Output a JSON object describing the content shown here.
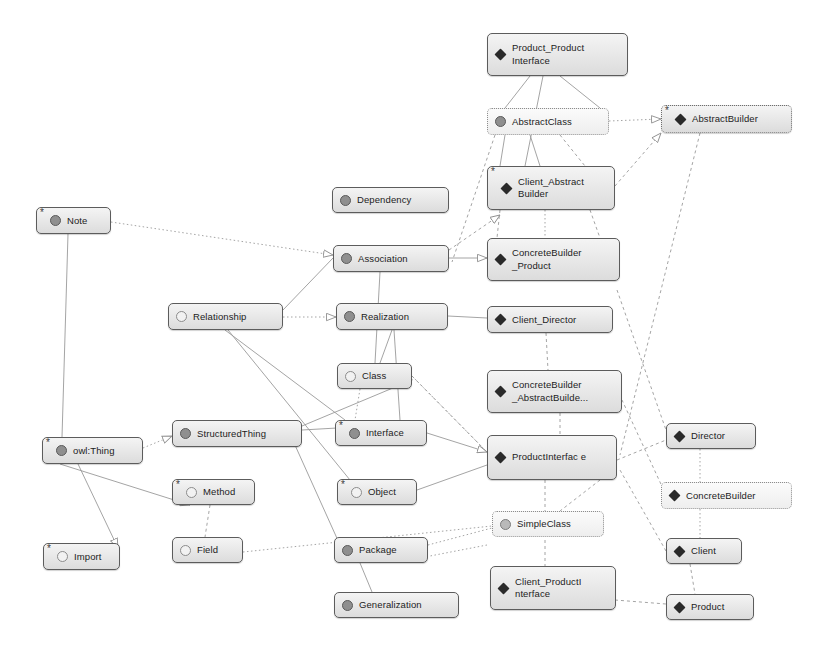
{
  "diagram": {
    "type": "node-link-graph",
    "width": 834,
    "height": 655,
    "background_color": "#ffffff",
    "node_fill_color": "#e4e4e4",
    "node_border_color": "#5c5c5c",
    "edge_color": "#9a9a9a",
    "icon_legend": [
      {
        "name": "diamond-icon",
        "meaning": "instance / individual"
      },
      {
        "name": "circle-dark-icon",
        "meaning": "class with subclasses"
      },
      {
        "name": "circle-light-icon",
        "meaning": "leaf class"
      }
    ],
    "nodes": [
      {
        "id": "product_product_interface",
        "label": "Product_Product\nInterface",
        "line1": "Product_Product",
        "line2": "Interface",
        "icon": "diamond-icon",
        "star": false,
        "style": "solid",
        "x": 487,
        "y": 33,
        "w": 141,
        "h": 43
      },
      {
        "id": "abstract_class",
        "label": "AbstractClass",
        "line1": "AbstractClass",
        "line2": "",
        "icon": "circle-dark-icon",
        "star": false,
        "style": "light",
        "x": 487,
        "y": 108,
        "w": 122,
        "h": 27
      },
      {
        "id": "abstract_builder",
        "label": "AbstractBuilder",
        "line1": "AbstractBuilder",
        "line2": "",
        "icon": "diamond-icon",
        "star": true,
        "style": "dotted",
        "x": 661,
        "y": 105,
        "w": 131,
        "h": 28
      },
      {
        "id": "client_abstract_builder",
        "label": "Client_Abstract\nBuilder",
        "line1": "Client_Abstract",
        "line2": "Builder",
        "icon": "diamond-icon",
        "star": true,
        "style": "solid",
        "x": 487,
        "y": 166,
        "w": 128,
        "h": 44
      },
      {
        "id": "dependency",
        "label": "Dependency",
        "line1": "Dependency",
        "line2": "",
        "icon": "circle-dark-icon",
        "star": false,
        "style": "solid",
        "x": 332,
        "y": 187,
        "w": 117,
        "h": 26
      },
      {
        "id": "note",
        "label": "Note",
        "line1": "Note",
        "line2": "",
        "icon": "circle-dark-icon",
        "star": true,
        "style": "solid",
        "x": 36,
        "y": 207,
        "w": 75,
        "h": 27
      },
      {
        "id": "association",
        "label": "Association",
        "line1": "Association",
        "line2": "",
        "icon": "circle-dark-icon",
        "star": false,
        "style": "solid",
        "x": 333,
        "y": 245,
        "w": 116,
        "h": 27
      },
      {
        "id": "concrete_builder_product",
        "label": "ConcreteBuilder\n_Product",
        "line1": "ConcreteBuilder",
        "line2": "_Product",
        "icon": "diamond-icon",
        "star": false,
        "style": "solid",
        "x": 487,
        "y": 238,
        "w": 133,
        "h": 43
      },
      {
        "id": "relationship",
        "label": "Relationship",
        "line1": "Relationship",
        "line2": "",
        "icon": "circle-light-icon",
        "star": false,
        "style": "solid",
        "x": 168,
        "y": 303,
        "w": 115,
        "h": 27
      },
      {
        "id": "realization",
        "label": "Realization",
        "line1": "Realization",
        "line2": "",
        "icon": "circle-dark-icon",
        "star": false,
        "style": "solid",
        "x": 336,
        "y": 303,
        "w": 112,
        "h": 27
      },
      {
        "id": "client_director",
        "label": "Client_Director",
        "line1": "Client_Director",
        "line2": "",
        "icon": "diamond-icon",
        "star": false,
        "style": "solid",
        "x": 487,
        "y": 306,
        "w": 126,
        "h": 27
      },
      {
        "id": "class",
        "label": "Class",
        "line1": "Class",
        "line2": "",
        "icon": "circle-light-icon",
        "star": false,
        "style": "solid",
        "x": 337,
        "y": 363,
        "w": 75,
        "h": 26
      },
      {
        "id": "concrete_builder_abstract_builder",
        "label": "ConcreteBuilder\n_AbstractBuilde...",
        "line1": "ConcreteBuilder",
        "line2": "_AbstractBuilde...",
        "icon": "diamond-icon",
        "star": false,
        "style": "solid",
        "x": 487,
        "y": 370,
        "w": 135,
        "h": 43
      },
      {
        "id": "structured_thing",
        "label": "StructuredThing",
        "line1": "StructuredThing",
        "line2": "",
        "icon": "circle-dark-icon",
        "star": false,
        "style": "solid",
        "x": 172,
        "y": 420,
        "w": 130,
        "h": 27
      },
      {
        "id": "interface",
        "label": "Interface",
        "line1": "Interface",
        "line2": "",
        "icon": "circle-dark-icon",
        "star": true,
        "style": "solid",
        "x": 335,
        "y": 420,
        "w": 92,
        "h": 26
      },
      {
        "id": "director",
        "label": "Director",
        "line1": "Director",
        "line2": "",
        "icon": "diamond-icon",
        "star": false,
        "style": "solid",
        "x": 666,
        "y": 423,
        "w": 90,
        "h": 26
      },
      {
        "id": "product_interface",
        "label": "ProductInterfac\ne",
        "line1": "ProductInterfac",
        "line2": "e",
        "icon": "diamond-icon",
        "star": false,
        "style": "solid",
        "x": 487,
        "y": 435,
        "w": 130,
        "h": 45
      },
      {
        "id": "owl_thing",
        "label": "owl:Thing",
        "line1": "owl:Thing",
        "line2": "",
        "icon": "circle-dark-icon",
        "star": true,
        "style": "solid",
        "x": 42,
        "y": 437,
        "w": 101,
        "h": 27
      },
      {
        "id": "method",
        "label": "Method",
        "line1": "Method",
        "line2": "",
        "icon": "circle-light-icon",
        "star": true,
        "style": "solid",
        "x": 172,
        "y": 479,
        "w": 83,
        "h": 26
      },
      {
        "id": "object",
        "label": "Object",
        "line1": "Object",
        "line2": "",
        "icon": "circle-light-icon",
        "star": true,
        "style": "solid",
        "x": 337,
        "y": 479,
        "w": 80,
        "h": 26
      },
      {
        "id": "concrete_builder",
        "label": "ConcreteBuilder",
        "line1": "ConcreteBuilder",
        "line2": "",
        "icon": "diamond-icon",
        "star": false,
        "style": "light",
        "x": 661,
        "y": 482,
        "w": 131,
        "h": 27
      },
      {
        "id": "simple_class",
        "label": "SimpleClass",
        "line1": "SimpleClass",
        "line2": "",
        "icon": "circle-mid-icon",
        "star": false,
        "style": "light",
        "x": 492,
        "y": 511,
        "w": 112,
        "h": 26
      },
      {
        "id": "field",
        "label": "Field",
        "line1": "Field",
        "line2": "",
        "icon": "circle-light-icon",
        "star": false,
        "style": "solid",
        "x": 172,
        "y": 537,
        "w": 71,
        "h": 26
      },
      {
        "id": "package",
        "label": "Package",
        "line1": "Package",
        "line2": "",
        "icon": "circle-dark-icon",
        "star": false,
        "style": "solid",
        "x": 334,
        "y": 537,
        "w": 94,
        "h": 26
      },
      {
        "id": "client",
        "label": "Client",
        "line1": "Client",
        "line2": "",
        "icon": "diamond-icon",
        "star": false,
        "style": "solid",
        "x": 666,
        "y": 538,
        "w": 76,
        "h": 26
      },
      {
        "id": "import",
        "label": "Import",
        "line1": "Import",
        "line2": "",
        "icon": "circle-light-icon",
        "star": true,
        "style": "solid",
        "x": 43,
        "y": 543,
        "w": 77,
        "h": 27
      },
      {
        "id": "client_product_interface",
        "label": "Client_ProductI\nnterface",
        "line1": "Client_ProductI",
        "line2": "nterface",
        "icon": "diamond-icon",
        "star": false,
        "style": "solid",
        "x": 490,
        "y": 566,
        "w": 126,
        "h": 44
      },
      {
        "id": "generalization",
        "label": "Generalization",
        "line1": "Generalization",
        "line2": "",
        "icon": "circle-dark-icon",
        "star": false,
        "style": "solid",
        "x": 334,
        "y": 592,
        "w": 125,
        "h": 26
      },
      {
        "id": "product",
        "label": "Product",
        "line1": "Product",
        "line2": "",
        "icon": "diamond-icon",
        "star": false,
        "style": "solid",
        "x": 666,
        "y": 594,
        "w": 88,
        "h": 26
      }
    ],
    "edges": [
      {
        "from": "note",
        "to": "association",
        "style": "dotted",
        "arrow": "hollow-triangle"
      },
      {
        "from": "abstract_class",
        "to": "abstract_builder",
        "style": "dotted",
        "arrow": "hollow-triangle"
      },
      {
        "from": "relationship",
        "to": "realization",
        "style": "dotted",
        "arrow": "hollow-triangle"
      },
      {
        "from": "owl_thing",
        "to": "structured_thing",
        "style": "dotted",
        "arrow": "hollow-triangle"
      },
      {
        "from": "field",
        "to": "simple_class",
        "style": "dotted",
        "arrow": "none"
      },
      {
        "from": "product_product_interface",
        "to": "abstract_class",
        "style": "solid",
        "arrow": "none"
      },
      {
        "from": "product_product_interface",
        "to": "client_abstract_builder",
        "style": "dashdot",
        "arrow": "none"
      },
      {
        "from": "abstract_class",
        "to": "client_abstract_builder",
        "style": "solid",
        "arrow": "none"
      },
      {
        "from": "abstract_class",
        "to": "concrete_builder_product",
        "style": "dashed",
        "arrow": "none"
      },
      {
        "from": "client_abstract_builder",
        "to": "concrete_builder_product",
        "style": "dashed",
        "arrow": "none"
      },
      {
        "from": "abstract_builder",
        "to": "client_abstract_builder",
        "style": "dashed",
        "arrow": "hollow-triangle"
      },
      {
        "from": "abstract_builder",
        "to": "product_interface",
        "style": "dashed",
        "arrow": "none"
      },
      {
        "from": "association",
        "to": "concrete_builder_product",
        "style": "solid",
        "arrow": "hollow-triangle"
      },
      {
        "from": "association",
        "to": "relationship",
        "style": "solid",
        "arrow": "none"
      },
      {
        "from": "association",
        "to": "class",
        "style": "solid",
        "arrow": "none"
      },
      {
        "from": "relationship",
        "to": "class",
        "style": "solid",
        "arrow": "none"
      },
      {
        "from": "relationship",
        "to": "generalization",
        "style": "solid",
        "arrow": "none"
      },
      {
        "from": "realization",
        "to": "class",
        "style": "solid",
        "arrow": "none"
      },
      {
        "from": "realization",
        "to": "interface",
        "style": "solid",
        "arrow": "none"
      },
      {
        "from": "class",
        "to": "interface",
        "style": "dotted",
        "arrow": "none"
      },
      {
        "from": "class",
        "to": "product_interface",
        "style": "solid",
        "arrow": "hollow-triangle"
      },
      {
        "from": "structured_thing",
        "to": "class",
        "style": "solid",
        "arrow": "hollow-triangle"
      },
      {
        "from": "structured_thing",
        "to": "interface",
        "style": "solid",
        "arrow": "none"
      },
      {
        "from": "structured_thing",
        "to": "package",
        "style": "solid",
        "arrow": "none"
      },
      {
        "from": "owl_thing",
        "to": "method",
        "style": "solid",
        "arrow": "hollow-triangle"
      },
      {
        "from": "owl_thing",
        "to": "import",
        "style": "solid",
        "arrow": "hollow-triangle"
      },
      {
        "from": "owl_thing",
        "to": "note",
        "style": "solid",
        "arrow": "none"
      },
      {
        "from": "method",
        "to": "field",
        "style": "dashed",
        "arrow": "none"
      },
      {
        "from": "package",
        "to": "generalization",
        "style": "solid",
        "arrow": "none"
      },
      {
        "from": "product_interface",
        "to": "simple_class",
        "style": "dashed",
        "arrow": "none"
      },
      {
        "from": "product_interface",
        "to": "client_product_interface",
        "style": "dashed",
        "arrow": "none"
      },
      {
        "from": "product_interface",
        "to": "director",
        "style": "dashed",
        "arrow": "none"
      },
      {
        "from": "director",
        "to": "concrete_builder",
        "style": "dotted",
        "arrow": "none"
      },
      {
        "from": "concrete_builder",
        "to": "client",
        "style": "dotted",
        "arrow": "none"
      },
      {
        "from": "client",
        "to": "product",
        "style": "dashed",
        "arrow": "none"
      },
      {
        "from": "client_director",
        "to": "concrete_builder_abstract_builder",
        "style": "dashed",
        "arrow": "none"
      },
      {
        "from": "concrete_builder_abstract_builder",
        "to": "product_interface",
        "style": "dashed",
        "arrow": "none"
      }
    ]
  }
}
